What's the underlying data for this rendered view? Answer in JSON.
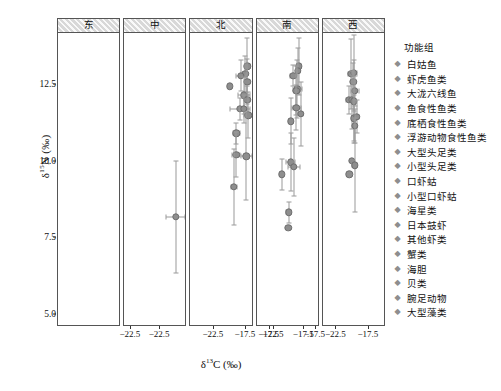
{
  "chart_data": {
    "type": "scatter",
    "title": "",
    "xlabel": "δ¹³C (‰)",
    "ylabel": "δ¹⁵N (‰)",
    "xlim": [
      -24.6,
      -15.2
    ],
    "ylim": [
      4.6,
      14.2
    ],
    "xticks": [
      -22.5,
      -17.5
    ],
    "xticklabels": [
      "−22.5",
      "−17.5"
    ],
    "yticks": [
      5.0,
      7.5,
      10.0,
      12.5
    ],
    "yticklabels": [
      "5.0",
      "7.5",
      "10.0",
      "12.5"
    ],
    "grid": false,
    "legend_position": "right",
    "marker_color": "#8e8e8e",
    "errorbar_color": "#9a9a9a",
    "facet_variable": "区域",
    "panels": [
      {
        "name": "东",
        "points": [
          {
            "x": -20.6,
            "y": 13.05,
            "xerr": 0.0,
            "yerr": 0.0
          },
          {
            "x": -20.9,
            "y": 12.6,
            "xerr": 0.0,
            "yerr": 0.0
          },
          {
            "x": -19.9,
            "y": 12.95,
            "xerr": 0.55,
            "yerr": 0.95
          },
          {
            "x": -20.0,
            "y": 12.8,
            "xerr": 0.25,
            "yerr": 0.55
          },
          {
            "x": -20.1,
            "y": 12.55,
            "xerr": 0.15,
            "yerr": 0.75
          },
          {
            "x": -19.7,
            "y": 12.45,
            "xerr": 0.2,
            "yerr": 0.5
          },
          {
            "x": -19.8,
            "y": 12.15,
            "xerr": 0.75,
            "yerr": 0.4
          },
          {
            "x": -20.2,
            "y": 11.95,
            "xerr": 0.55,
            "yerr": 0.3
          },
          {
            "x": -20.5,
            "y": 11.6,
            "xerr": 0.75,
            "yerr": 0.45
          },
          {
            "x": -20.1,
            "y": 11.55,
            "xerr": 0.3,
            "yerr": 0.35
          },
          {
            "x": -19.9,
            "y": 11.4,
            "xerr": 0.45,
            "yerr": 0.55
          },
          {
            "x": -19.6,
            "y": 10.35,
            "xerr": 0.35,
            "yerr": 0.7
          },
          {
            "x": -21.1,
            "y": 10.0,
            "xerr": 0.7,
            "yerr": 1.55
          },
          {
            "x": -20.3,
            "y": 9.4,
            "xerr": 1.55,
            "yerr": 1.05
          },
          {
            "x": -20.8,
            "y": 7.55,
            "xerr": 1.1,
            "yerr": 2.35
          }
        ]
      },
      {
        "name": "中",
        "points": [
          {
            "x": -19.7,
            "y": 12.95,
            "xerr": 0.45,
            "yerr": 1.1
          },
          {
            "x": -19.4,
            "y": 12.95,
            "xerr": 0.3,
            "yerr": 1.05
          },
          {
            "x": -19.8,
            "y": 12.7,
            "xerr": 0.4,
            "yerr": 0.35
          },
          {
            "x": -19.1,
            "y": 12.6,
            "xerr": 0.0,
            "yerr": 0.0
          },
          {
            "x": -19.7,
            "y": 12.35,
            "xerr": 0.55,
            "yerr": 0.95
          },
          {
            "x": -19.7,
            "y": 12.25,
            "xerr": 0.2,
            "yerr": 0.85
          },
          {
            "x": -20.6,
            "y": 12.1,
            "xerr": 0.0,
            "yerr": 0.0
          },
          {
            "x": -19.8,
            "y": 11.55,
            "xerr": 0.45,
            "yerr": 0.8
          },
          {
            "x": -20.0,
            "y": 11.35,
            "xerr": 0.45,
            "yerr": 0.3
          },
          {
            "x": -19.4,
            "y": 11.4,
            "xerr": 0.3,
            "yerr": 0.35
          },
          {
            "x": -19.5,
            "y": 11.15,
            "xerr": 0.35,
            "yerr": 0.4
          },
          {
            "x": -20.6,
            "y": 10.75,
            "xerr": 0.0,
            "yerr": 0.0
          },
          {
            "x": -19.8,
            "y": 9.95,
            "xerr": 0.35,
            "yerr": 1.35
          },
          {
            "x": -21.6,
            "y": 8.15,
            "xerr": 0.55,
            "yerr": 1.85
          }
        ]
      },
      {
        "name": "北",
        "points": [
          {
            "x": -19.5,
            "y": 13.1,
            "xerr": 0.25,
            "yerr": 0.95
          },
          {
            "x": -19.7,
            "y": 12.85,
            "xerr": 0.2,
            "yerr": 0.6
          },
          {
            "x": -20.1,
            "y": 12.8,
            "xerr": 0.45,
            "yerr": 0.5
          },
          {
            "x": -19.5,
            "y": 12.6,
            "xerr": 0.2,
            "yerr": 0.75
          },
          {
            "x": -21.1,
            "y": 12.45,
            "xerr": 0.0,
            "yerr": 0.0
          },
          {
            "x": -19.8,
            "y": 12.15,
            "xerr": 0.55,
            "yerr": 0.6
          },
          {
            "x": -19.5,
            "y": 12.0,
            "xerr": 0.25,
            "yerr": 0.45
          },
          {
            "x": -20.2,
            "y": 11.7,
            "xerr": 0.9,
            "yerr": 0.35
          },
          {
            "x": -19.8,
            "y": 11.7,
            "xerr": 0.35,
            "yerr": 0.45
          },
          {
            "x": -19.4,
            "y": 11.5,
            "xerr": 0.4,
            "yerr": 0.75
          },
          {
            "x": -20.5,
            "y": 10.9,
            "xerr": 0.3,
            "yerr": 0.35
          },
          {
            "x": -20.5,
            "y": 10.2,
            "xerr": 0.35,
            "yerr": 0.75
          },
          {
            "x": -19.6,
            "y": 10.15,
            "xerr": 0.5,
            "yerr": 1.45
          },
          {
            "x": -20.7,
            "y": 9.15,
            "xerr": 0.3,
            "yerr": 1.25
          }
        ]
      },
      {
        "name": "南",
        "points": [
          {
            "x": -19.5,
            "y": 13.1,
            "xerr": 0.25,
            "yerr": 0.95
          },
          {
            "x": -19.6,
            "y": 12.95,
            "xerr": 0.2,
            "yerr": 0.75
          },
          {
            "x": -20.2,
            "y": 12.8,
            "xerr": 0.35,
            "yerr": 0.35
          },
          {
            "x": -19.7,
            "y": 12.35,
            "xerr": 0.55,
            "yerr": 0.95
          },
          {
            "x": -19.8,
            "y": 12.3,
            "xerr": 0.25,
            "yerr": 0.8
          },
          {
            "x": -19.8,
            "y": 11.75,
            "xerr": 0.5,
            "yerr": 0.75
          },
          {
            "x": -19.3,
            "y": 11.55,
            "xerr": 0.3,
            "yerr": 1.05
          },
          {
            "x": -20.5,
            "y": 11.3,
            "xerr": 0.25,
            "yerr": 0.75
          },
          {
            "x": -20.5,
            "y": 9.95,
            "xerr": 0.5,
            "yerr": 0.95
          },
          {
            "x": -20.1,
            "y": 9.8,
            "xerr": 0.7,
            "yerr": 0.95
          },
          {
            "x": -21.6,
            "y": 9.55,
            "xerr": 0.15,
            "yerr": 0.5
          },
          {
            "x": -20.7,
            "y": 8.3,
            "xerr": 0.3,
            "yerr": 0.35
          },
          {
            "x": -20.8,
            "y": 7.8,
            "xerr": 0.0,
            "yerr": 0.0
          }
        ]
      },
      {
        "name": "西",
        "points": [
          {
            "x": -20.2,
            "y": 12.85,
            "xerr": 0.5,
            "yerr": 1.15
          },
          {
            "x": -19.8,
            "y": 12.9,
            "xerr": 0.45,
            "yerr": 1.25
          },
          {
            "x": -19.9,
            "y": 12.6,
            "xerr": 0.35,
            "yerr": 0.6
          },
          {
            "x": -19.7,
            "y": 12.3,
            "xerr": 0.6,
            "yerr": 0.5
          },
          {
            "x": -20.6,
            "y": 12.0,
            "xerr": 0.45,
            "yerr": 0.45
          },
          {
            "x": -20.1,
            "y": 12.0,
            "xerr": 0.25,
            "yerr": 0.95
          },
          {
            "x": -19.8,
            "y": 11.95,
            "xerr": 0.25,
            "yerr": 1.35
          },
          {
            "x": -19.8,
            "y": 11.4,
            "xerr": 0.35,
            "yerr": 0.75
          },
          {
            "x": -19.4,
            "y": 11.45,
            "xerr": 0.3,
            "yerr": 0.55
          },
          {
            "x": -19.7,
            "y": 11.15,
            "xerr": 0.1,
            "yerr": 0.55
          },
          {
            "x": -20.1,
            "y": 10.0,
            "xerr": 0.0,
            "yerr": 0.0
          },
          {
            "x": -19.7,
            "y": 9.85,
            "xerr": 0.35,
            "yerr": 1.55
          },
          {
            "x": -20.5,
            "y": 9.55,
            "xerr": 0.0,
            "yerr": 0.0
          }
        ]
      }
    ],
    "legend": {
      "title": "功能组",
      "entries": [
        "白姑鱼",
        "虾虎鱼类",
        "大泷六线鱼",
        "鱼食性鱼类",
        "底栖食性鱼类",
        "浮游动物食性鱼类",
        "大型头足类",
        "小型头足类",
        "口虾蛄",
        "小型口虾蛄",
        "海星类",
        "日本鼓虾",
        "其他虾类",
        "蟹类",
        "海胆",
        "贝类",
        "腕足动物",
        "大型藻类"
      ]
    }
  }
}
